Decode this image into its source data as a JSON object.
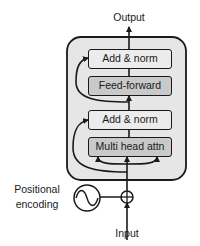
{
  "diagram": {
    "type": "transformer-encoder-block",
    "output_label": "Output",
    "input_label": "Input",
    "positional_encoding_label": [
      "Positional",
      "encoding"
    ],
    "blocks": [
      {
        "label": "Add & norm",
        "shade": "light"
      },
      {
        "label": "Feed-forward",
        "shade": "dark"
      },
      {
        "label": "Add & norm",
        "shade": "light"
      },
      {
        "label": "Multi head attn",
        "shade": "dark"
      }
    ],
    "symbols": {
      "sum": "circle-plus",
      "positional_encoding": "sine-wave-circle"
    },
    "colors": {
      "container_fill": "#e6e6e6",
      "light_block": "#ececec",
      "dark_block": "#c9c9c9",
      "stroke": "#1a1a1a"
    }
  }
}
